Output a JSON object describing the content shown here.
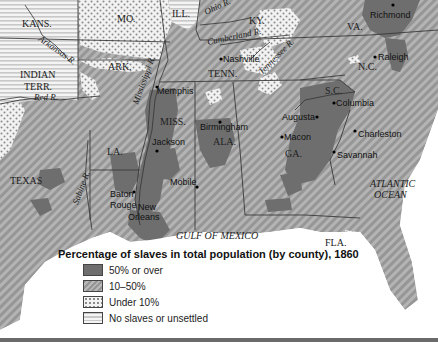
{
  "map": {
    "title": "Percentage of slaves in total population (by county), 1860",
    "colors": {
      "over_50": "#6e6e6e",
      "between_10_50": "#a8a8a8",
      "under_10": "#e6e6e6",
      "none": "#f0f0f0",
      "water": "#ffffff",
      "border": "#3a3a3a"
    },
    "states": {
      "kans": "KANS.",
      "mo": "MO.",
      "ill": "ILL.",
      "ky": "KY.",
      "va": "VA.",
      "ark": "ARK.",
      "indian_terr_1": "INDIAN",
      "indian_terr_2": "TERR.",
      "tenn": "TENN.",
      "nc": "N.C.",
      "sc": "S.C.",
      "miss": "MISS.",
      "ala": "ALA.",
      "ga": "GA.",
      "la": "LA.",
      "texas": "TEXAS",
      "fla": "FLA."
    },
    "rivers": {
      "ohio": "Ohio R.",
      "arkansas": "Arkansas R.",
      "cumberland": "Cumberland R.",
      "tennessee": "Tennessee R.",
      "mississippi": "Mississippi R.",
      "red": "Red R.",
      "sabine": "Sabine R."
    },
    "cities": {
      "richmond": "Richmond",
      "raleigh": "Raleigh",
      "nashville": "Nashville",
      "memphis": "Memphis",
      "columbia": "Columbia",
      "augusta": "Augusta",
      "charleston": "Charleston",
      "birmingham": "Birmingham",
      "macon": "Macon",
      "savannah": "Savannah",
      "jackson": "Jackson",
      "mobile": "Mobile",
      "baton_rouge_1": "Baton",
      "baton_rouge_2": "Rouge",
      "new_orleans_1": "New",
      "new_orleans_2": "Orleans"
    },
    "water": {
      "atlantic_1": "ATLANTIC",
      "atlantic_2": "OCEAN",
      "gulf": "GULF OF MEXICO"
    }
  },
  "legend": {
    "title": "Percentage of slaves in total population (by county), 1860",
    "items": [
      {
        "label": "50% or over",
        "pattern": "dark"
      },
      {
        "label": "10–50%",
        "pattern": "hatched"
      },
      {
        "label": "Under 10%",
        "pattern": "dotted"
      },
      {
        "label": "No slaves or unsettled",
        "pattern": "striped"
      }
    ]
  }
}
